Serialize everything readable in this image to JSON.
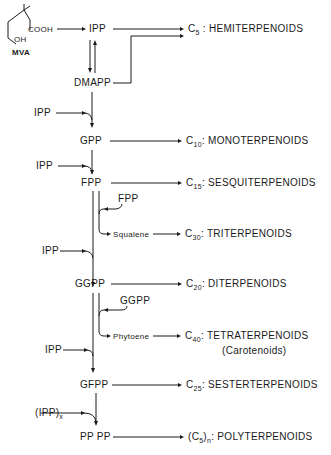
{
  "start": {
    "name": "MVA",
    "cooh": "COOH",
    "oh": "OH"
  },
  "nodes": {
    "ipp": "IPP",
    "dmapp": "DMAPP",
    "gpp": "GPP",
    "fpp": "FPP",
    "ggpp": "GGPP",
    "gfpp": "GFPP",
    "pppp": "PP PP"
  },
  "inputs": {
    "ipp1": "IPP",
    "ipp2": "IPP",
    "ipp3": "IPP",
    "ipp4": "IPP",
    "ippx": "(IPP)",
    "ippx_sub": "x",
    "fpp_side": "FPP",
    "ggpp_side": "GGPP"
  },
  "intermediates": {
    "squalene": "Squalene",
    "phytoene": "Phytoene"
  },
  "products": [
    {
      "c": "C",
      "sub": "5",
      "label": ": HEMITERPENOIDS"
    },
    {
      "c": "C",
      "sub": "10",
      "label": ": MONOTERPENOIDS"
    },
    {
      "c": "C",
      "sub": "15",
      "label": ": SESQUITERPENOIDS"
    },
    {
      "c": "C",
      "sub": "30",
      "label": ": TRITERPENOIDS"
    },
    {
      "c": "C",
      "sub": "20",
      "label": ": DITERPENOIDS"
    },
    {
      "c": "C",
      "sub": "40",
      "label": ": TETRATERPENOIDS",
      "note": "(Carotenoids)"
    },
    {
      "c": "C",
      "sub": "25",
      "label": ": SESTERTERPENOIDS"
    },
    {
      "c": "(C",
      "sub": "5",
      "c2": ")",
      "sub2": "n",
      "label": ": POLYTERPENOIDS"
    }
  ]
}
